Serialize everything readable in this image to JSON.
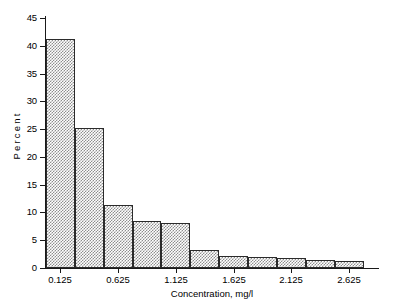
{
  "chart_data": {
    "type": "bar",
    "title": "",
    "subtitle": "",
    "xlabel": "Concentration, mg/l",
    "ylabel": "Percent",
    "grid": false,
    "legend": "none",
    "ylim": [
      0,
      45
    ],
    "xlim": [
      0,
      2.875
    ],
    "bin_width": 0.25,
    "bin_edges": [
      0.0,
      0.25,
      0.5,
      0.75,
      1.0,
      1.25,
      1.5,
      1.75,
      2.0,
      2.25,
      2.5,
      2.75
    ],
    "categories": [
      "0.125",
      "0.375",
      "0.625",
      "0.875",
      "1.125",
      "1.375",
      "1.625",
      "1.875",
      "2.125",
      "2.375",
      "2.625"
    ],
    "values": [
      41.3,
      25.2,
      11.3,
      8.4,
      8.1,
      3.3,
      2.2,
      2.0,
      1.8,
      1.5,
      1.2
    ],
    "ytick_labels": [
      "0",
      "5",
      "10",
      "15",
      "20",
      "25",
      "30",
      "35",
      "40",
      "45"
    ],
    "ytick_values": [
      0,
      5,
      10,
      15,
      20,
      25,
      30,
      35,
      40,
      45
    ],
    "xtick_labels": [
      "0.125",
      "0.625",
      "1.125",
      "1.625",
      "2.125",
      "2.625"
    ],
    "xtick_values": [
      0.125,
      0.625,
      1.125,
      1.625,
      2.125,
      2.625
    ],
    "bar_fill": "#8e8e8e",
    "bar_edge": "#2b2b2b",
    "axis_color": "#1a1a1a",
    "background": "#ffffff"
  }
}
